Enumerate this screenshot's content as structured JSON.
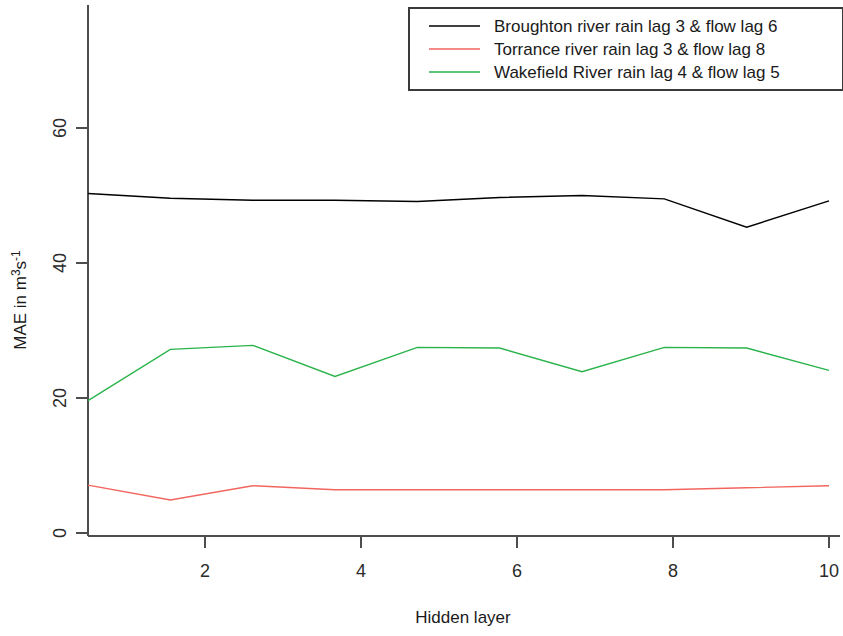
{
  "chart_data": {
    "type": "line",
    "title": "",
    "xlabel": "Hidden layer",
    "ylabel": "MAE in m3s-1",
    "ylabel_display": "MAE in m",
    "ylabel_sup": "3",
    "ylabel_mid": "s",
    "ylabel_sup2": "-1",
    "x": [
      1,
      2,
      3,
      4,
      5,
      6,
      7,
      8,
      9,
      10
    ],
    "xlim": [
      0.6,
      10.4
    ],
    "ylim": [
      -2,
      68
    ],
    "xticks": [
      2,
      4,
      6,
      8,
      10
    ],
    "xtick_labels": [
      "2",
      "4",
      "6",
      "8",
      "10"
    ],
    "yticks": [
      0,
      20,
      40,
      60
    ],
    "ytick_labels": [
      "0",
      "20",
      "40",
      "60"
    ],
    "grid": false,
    "legend_position": "top-right",
    "series": [
      {
        "name": "Broughton river rain lag 3 & flow lag 6",
        "color": "#000000",
        "values": [
          50.3,
          49.6,
          49.3,
          49.3,
          49.1,
          49.7,
          50.0,
          49.5,
          45.3,
          49.2
        ]
      },
      {
        "name": "Torrance river rain lag 3 & flow lag 8",
        "color": "#f2655f",
        "values": [
          7.1,
          4.9,
          7.0,
          6.4,
          6.4,
          6.4,
          6.4,
          6.4,
          6.7,
          7.0
        ]
      },
      {
        "name": "Wakefield River rain lag 4 & flow lag 5",
        "color": "#2ab34a",
        "values": [
          19.6,
          27.2,
          27.8,
          23.2,
          27.5,
          27.4,
          23.9,
          27.5,
          27.4,
          24.1
        ]
      }
    ]
  },
  "legend": {
    "entries": [
      {
        "label": "Broughton river rain lag 3 & flow lag 6",
        "color": "#000000"
      },
      {
        "label": "Torrance river rain lag 3 & flow lag 8",
        "color": "#f2655f"
      },
      {
        "label": "Wakefield River rain lag 4 & flow lag 5",
        "color": "#2ab34a"
      }
    ]
  },
  "axes": {
    "x_title": "Hidden layer",
    "y_title_base": "MAE in m",
    "y_title_sup1": "3",
    "y_title_mid": "s",
    "y_title_sup2": "-1",
    "x_tick_labels": [
      "2",
      "4",
      "6",
      "8",
      "10"
    ],
    "y_tick_labels": [
      "0",
      "20",
      "40",
      "60"
    ]
  }
}
